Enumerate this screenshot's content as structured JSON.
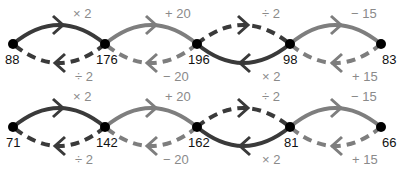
{
  "colors": {
    "dark": "#3a3a3a",
    "gray": "#7e7e7e",
    "node": "#000000",
    "node_text": "#111111",
    "op_text": "#8a8a8a"
  },
  "node_x": [
    13,
    105,
    197,
    290,
    381
  ],
  "rows": [
    {
      "y": 44,
      "nodes": [
        "88",
        "176",
        "196",
        "98",
        "83"
      ],
      "segments": [
        {
          "top_op": "× 2",
          "top_style": "solid",
          "top_color": "dark",
          "bottom_op": "÷ 2",
          "bottom_style": "dashed",
          "bottom_color": "dark"
        },
        {
          "top_op": "+ 20",
          "top_style": "solid",
          "top_color": "gray",
          "bottom_op": "− 20",
          "bottom_style": "dashed",
          "bottom_color": "gray"
        },
        {
          "top_op": "÷ 2",
          "top_style": "dashed",
          "top_color": "dark",
          "bottom_op": "× 2",
          "bottom_style": "solid",
          "bottom_color": "dark"
        },
        {
          "top_op": "− 15",
          "top_style": "solid",
          "top_color": "gray",
          "bottom_op": "+ 15",
          "bottom_style": "dashed",
          "bottom_color": "gray"
        }
      ]
    },
    {
      "y": 127,
      "nodes": [
        "71",
        "142",
        "162",
        "81",
        "66"
      ],
      "segments": [
        {
          "top_op": "× 2",
          "top_style": "solid",
          "top_color": "dark",
          "bottom_op": "÷ 2",
          "bottom_style": "dashed",
          "bottom_color": "dark"
        },
        {
          "top_op": "+ 20",
          "top_style": "solid",
          "top_color": "gray",
          "bottom_op": "− 20",
          "bottom_style": "dashed",
          "bottom_color": "gray"
        },
        {
          "top_op": "÷ 2",
          "top_style": "dashed",
          "top_color": "dark",
          "bottom_op": "× 2",
          "bottom_style": "solid",
          "bottom_color": "dark"
        },
        {
          "top_op": "− 15",
          "top_style": "solid",
          "top_color": "gray",
          "bottom_op": "+ 15",
          "bottom_style": "dashed",
          "bottom_color": "gray"
        }
      ]
    }
  ]
}
